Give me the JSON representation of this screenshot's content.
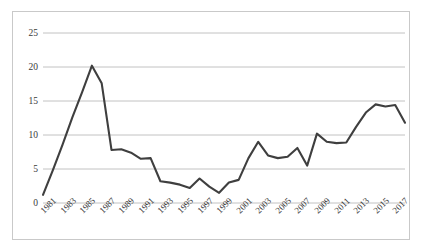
{
  "chart_data": {
    "type": "line",
    "title": "",
    "xlabel": "",
    "ylabel": "",
    "ylim": [
      0,
      25
    ],
    "yticks": [
      0,
      5,
      10,
      15,
      20,
      25
    ],
    "grid": true,
    "legend": false,
    "line_color": "#3f3f3f",
    "x": [
      1981,
      1982,
      1983,
      1984,
      1985,
      1986,
      1987,
      1988,
      1989,
      1990,
      1991,
      1992,
      1993,
      1994,
      1995,
      1996,
      1997,
      1998,
      1999,
      2000,
      2001,
      2002,
      2003,
      2004,
      2005,
      2006,
      2007,
      2008,
      2009,
      2010,
      2011,
      2012,
      2013,
      2014,
      2015,
      2016,
      2017,
      2018
    ],
    "values": [
      1.2,
      4.8,
      8.6,
      12.6,
      16.3,
      20.2,
      17.6,
      7.8,
      7.9,
      7.4,
      6.5,
      6.6,
      3.2,
      3.0,
      2.7,
      2.2,
      3.6,
      2.4,
      1.5,
      3.0,
      3.4,
      6.6,
      9.0,
      7.0,
      6.6,
      6.8,
      8.1,
      5.5,
      10.2,
      9.0,
      8.8,
      8.9,
      11.2,
      13.3,
      14.5,
      14.2,
      14.4,
      11.8
    ],
    "xtick_labels": [
      "1981",
      "1983",
      "1985",
      "1987",
      "1989",
      "1991",
      "1993",
      "1995",
      "1997",
      "1999",
      "2001",
      "2003",
      "2005",
      "2007",
      "2009",
      "2011",
      "2013",
      "2015",
      "2017"
    ],
    "xtick_values": [
      1981,
      1983,
      1985,
      1987,
      1989,
      1991,
      1993,
      1995,
      1997,
      1999,
      2001,
      2003,
      2005,
      2007,
      2009,
      2011,
      2013,
      2015,
      2017
    ]
  }
}
